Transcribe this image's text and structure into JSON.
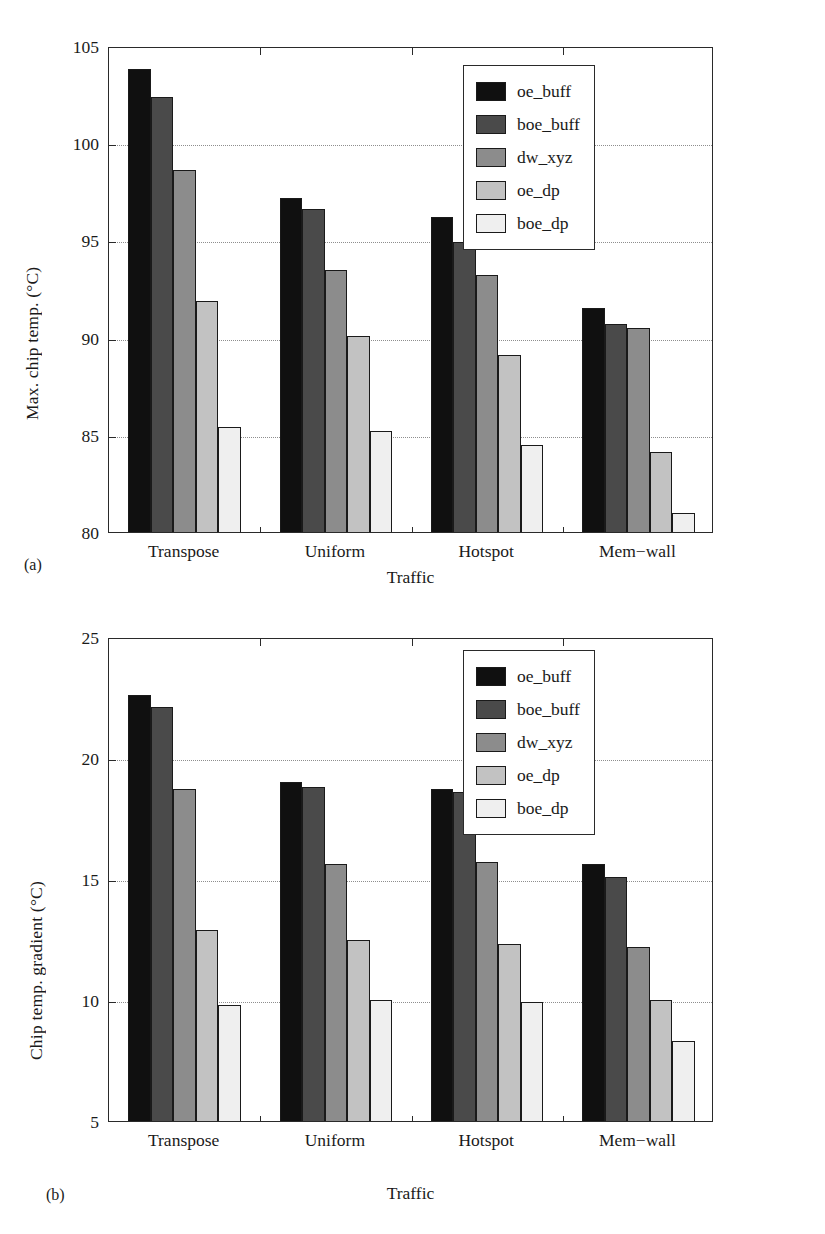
{
  "figure": {
    "panels": [
      {
        "tag": "(a)",
        "ylabel": "Max. chip temp. (°C)",
        "xlabel": "Traffic"
      },
      {
        "tag": "(b)",
        "ylabel": "Chip temp. gradient (°C)",
        "xlabel": "Traffic"
      }
    ]
  },
  "series_colors": {
    "oe_buff": "#101010",
    "boe_buff": "#4a4a4a",
    "dw_xyz": "#8c8c8c",
    "oe_dp": "#c2c2c2",
    "boe_dp": "#efefef"
  },
  "chart_data": [
    {
      "type": "bar",
      "title": "",
      "panel": "(a)",
      "xlabel": "Traffic",
      "ylabel": "Max. chip temp. (°C)",
      "categories": [
        "Transpose",
        "Uniform",
        "Hotspot",
        "Mem−wall"
      ],
      "ylim": [
        80,
        105
      ],
      "yticks": [
        80,
        85,
        90,
        95,
        100,
        105
      ],
      "ytick_labels": [
        "80",
        "85",
        "90",
        "95",
        "100",
        "105"
      ],
      "grid": true,
      "legend_position": "top-right",
      "series": [
        {
          "name": "oe_buff",
          "values": [
            103.8,
            97.2,
            96.2,
            91.5
          ]
        },
        {
          "name": "boe_buff",
          "values": [
            102.4,
            96.6,
            94.9,
            90.7
          ]
        },
        {
          "name": "dw_xyz",
          "values": [
            98.6,
            93.5,
            93.2,
            90.5
          ]
        },
        {
          "name": "oe_dp",
          "values": [
            91.9,
            90.1,
            89.1,
            84.1
          ]
        },
        {
          "name": "boe_dp",
          "values": [
            85.4,
            85.2,
            84.5,
            81.0
          ]
        }
      ]
    },
    {
      "type": "bar",
      "title": "",
      "panel": "(b)",
      "xlabel": "Traffic",
      "ylabel": "Chip temp. gradient (°C)",
      "categories": [
        "Transpose",
        "Uniform",
        "Hotspot",
        "Mem−wall"
      ],
      "ylim": [
        5,
        25
      ],
      "yticks": [
        5,
        10,
        15,
        20,
        25
      ],
      "ytick_labels": [
        "5",
        "10",
        "15",
        "20",
        "25"
      ],
      "grid": true,
      "legend_position": "top-right",
      "series": [
        {
          "name": "oe_buff",
          "values": [
            22.6,
            19.0,
            18.7,
            15.6
          ]
        },
        {
          "name": "boe_buff",
          "values": [
            22.1,
            18.8,
            18.6,
            15.1
          ]
        },
        {
          "name": "dw_xyz",
          "values": [
            18.7,
            15.6,
            15.7,
            12.2
          ]
        },
        {
          "name": "oe_dp",
          "values": [
            12.9,
            12.5,
            12.3,
            10.0
          ]
        },
        {
          "name": "boe_dp",
          "values": [
            9.8,
            10.0,
            9.9,
            8.3
          ]
        }
      ]
    }
  ],
  "legend": {
    "items": [
      {
        "label": "oe_buff"
      },
      {
        "label": "boe_buff"
      },
      {
        "label": "dw_xyz"
      },
      {
        "label": "oe_dp"
      },
      {
        "label": "boe_dp"
      }
    ]
  }
}
